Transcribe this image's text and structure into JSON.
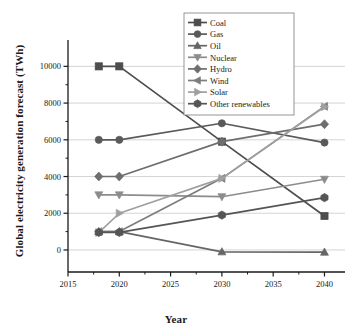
{
  "chart_data": {
    "type": "line",
    "title": "",
    "xlabel": "Year",
    "ylabel": "Global electricity generation forecast (TWh)",
    "xlim": [
      2015,
      2042
    ],
    "ylim": [
      -1200,
      11000
    ],
    "xticks": [
      2015,
      2020,
      2025,
      2030,
      2035,
      2040
    ],
    "yticks": [
      0,
      2000,
      4000,
      6000,
      8000,
      10000
    ],
    "grid": "horizontal-major",
    "legend_position": "top-right",
    "x": [
      2018,
      2020,
      2030,
      2040
    ],
    "series": [
      {
        "name": "Coal",
        "marker": "square",
        "color": "#4d4d4d",
        "values": [
          10000,
          10000,
          5900,
          1850
        ]
      },
      {
        "name": "Gas",
        "marker": "circle",
        "color": "#5a5a5a",
        "values": [
          6000,
          6000,
          6900,
          5850
        ]
      },
      {
        "name": "Oil",
        "marker": "triangle-up",
        "color": "#666666",
        "values": [
          1000,
          1000,
          -100,
          -120
        ]
      },
      {
        "name": "Nuclear",
        "marker": "triangle-down",
        "color": "#8c8c8c",
        "values": [
          3000,
          3000,
          2900,
          3850
        ]
      },
      {
        "name": "Hydro",
        "marker": "diamond",
        "color": "#6e6e6e",
        "values": [
          4000,
          4000,
          5900,
          6850
        ]
      },
      {
        "name": "Wind",
        "marker": "triangle-left",
        "color": "#7d7d7d",
        "values": [
          1000,
          1000,
          3900,
          7820
        ]
      },
      {
        "name": "Solar",
        "marker": "triangle-right",
        "color": "#a0a0a0",
        "values": [
          950,
          2000,
          3900,
          7800
        ]
      },
      {
        "name": "Other renewables",
        "marker": "hexagon",
        "color": "#555555",
        "values": [
          960,
          960,
          1900,
          2850
        ]
      }
    ]
  },
  "axes": {
    "x_tick_labels": [
      "2015",
      "2020",
      "2025",
      "2030",
      "2035",
      "2040"
    ],
    "y_tick_labels": [
      "0",
      "2000",
      "4000",
      "6000",
      "8000",
      "10000"
    ],
    "x_title": "Year",
    "y_title": "Global electricity generation forecast (TWh)"
  },
  "legend": {
    "items": [
      {
        "label": "Coal"
      },
      {
        "label": "Gas"
      },
      {
        "label": "Oil"
      },
      {
        "label": "Nuclear"
      },
      {
        "label": "Hydro"
      },
      {
        "label": "Wind"
      },
      {
        "label": "Solar"
      },
      {
        "label": "Other renewables"
      }
    ]
  }
}
